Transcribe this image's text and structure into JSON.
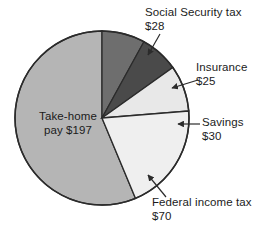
{
  "chart_data": {
    "type": "pie",
    "title": "",
    "subtitle": "",
    "xlabel": "",
    "ylabel": "",
    "legend_position": "none",
    "grid": false,
    "units": "USD",
    "total": 350,
    "categories": [
      "Social Security tax",
      "Insurance",
      "Savings",
      "Federal income tax",
      "Take-home pay"
    ],
    "values": [
      28,
      25,
      30,
      70,
      197
    ],
    "slices": [
      {
        "name": "Social Security tax",
        "label": "Social Security tax",
        "value": 28,
        "value_text": "$28",
        "color": "#6e6e6e",
        "start_angle": 0.0,
        "end_angle": 28.8,
        "label_position": "outside-top-right"
      },
      {
        "name": "Insurance",
        "label": "Insurance",
        "value": 25,
        "value_text": "$25",
        "color": "#4a4a4a",
        "start_angle": 28.8,
        "end_angle": 54.5,
        "label_position": "outside-right"
      },
      {
        "name": "Savings",
        "label": "Savings",
        "value": 30,
        "value_text": "$30",
        "color": "#e8e8e8",
        "start_angle": 54.5,
        "end_angle": 85.4,
        "label_position": "outside-right"
      },
      {
        "name": "Federal income tax",
        "label": "Federal income tax",
        "value": 70,
        "value_text": "$70",
        "color": "#efefef",
        "start_angle": 85.4,
        "end_angle": 157.4,
        "label_position": "outside-bottom-right"
      },
      {
        "name": "Take-home pay",
        "label": "Take-home",
        "value": 197,
        "value_text": "pay $197",
        "color": "#b5b5b5",
        "start_angle": 157.4,
        "end_angle": 360.0,
        "label_position": "inside-left"
      }
    ]
  },
  "labels": {
    "take_home_line1": "Take-home",
    "take_home_line2": "pay $197",
    "social_security_line1": "Social Security tax",
    "social_security_line2": "$28",
    "insurance_line1": "Insurance",
    "insurance_line2": "$25",
    "savings_line1": "Savings",
    "savings_line2": "$30",
    "federal_income_tax_line1": "Federal income tax",
    "federal_income_tax_line2": "$70"
  },
  "style": {
    "background": "#ffffff",
    "outline": "#2b2b2b",
    "text": "#1b1b1b",
    "leader": "#2b2b2b"
  }
}
